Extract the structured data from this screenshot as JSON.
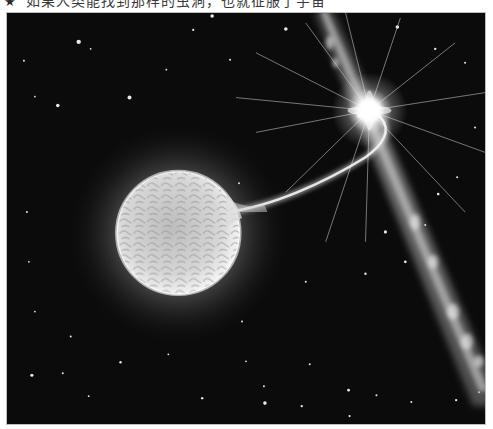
{
  "caption": {
    "marker": "★",
    "text": "如果人类能找到那样的虫洞，也就征服了宇宙"
  },
  "figure": {
    "elements": [
      "textured-giant-star",
      "accretion-stream",
      "bright-compact-star",
      "light-rays",
      "relativistic-jet",
      "background-stars"
    ],
    "colors": {
      "space": "#0c0c0c",
      "glow": "#ffffff",
      "star_surface": "#d9d9d9"
    }
  }
}
